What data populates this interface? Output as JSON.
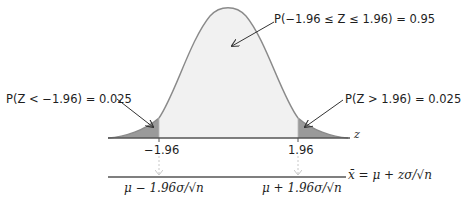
{
  "figure": {
    "type": "standard-normal-confidence-interval-diagram",
    "colors": {
      "curve_stroke": "#8a8a8a",
      "center_fill": "#f1f1f1",
      "tail_fill": "#9a9a9a",
      "axis": "#555555",
      "arrow": "#333333",
      "dashed_arrow": "#c8c8c8"
    },
    "annotations": {
      "center_prob": "P(−1.96 ≤ Z ≤ 1.96) = 0.95",
      "left_tail": "P(Z < −1.96) = 0.025",
      "right_tail": "P(Z > 1.96) = 0.025"
    },
    "z_axis": {
      "label": "z",
      "ticks": [
        "−1.96",
        "1.96"
      ]
    },
    "xbar_axis": {
      "label": "x̄ = μ + zσ/√n",
      "ticks": [
        "μ − 1.96σ/√n",
        "μ + 1.96σ/√n"
      ]
    }
  }
}
